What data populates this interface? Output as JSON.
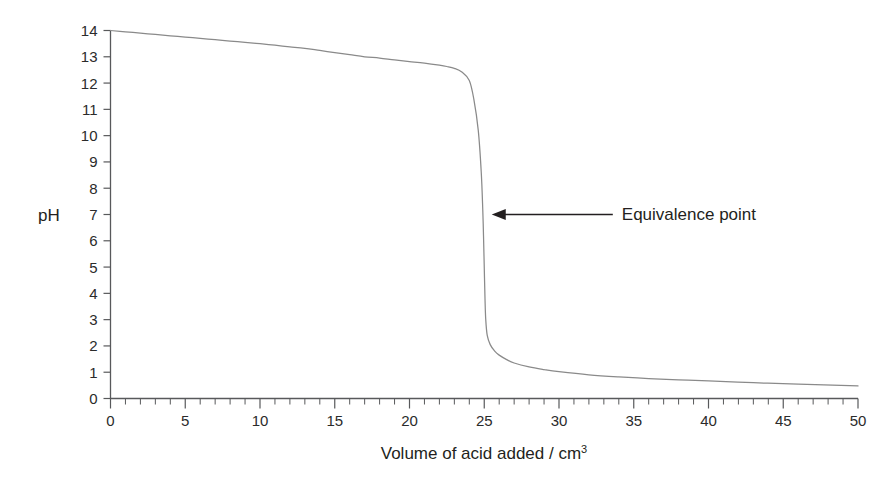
{
  "chart_data": {
    "type": "line",
    "title": "",
    "subtitle": "",
    "xlabel": "Volume of acid added / cm",
    "xlabel_superscript": "3",
    "ylabel": "pH",
    "xlim": [
      0,
      50
    ],
    "ylim": [
      0,
      14
    ],
    "grid": false,
    "legend_position": "none",
    "x_major_step": 5,
    "x_minor_step": 1,
    "y_major_step": 1,
    "x_tick_labels": [
      "0",
      "5",
      "10",
      "15",
      "20",
      "25",
      "30",
      "35",
      "40",
      "45",
      "50"
    ],
    "y_tick_labels": [
      "0",
      "1",
      "2",
      "3",
      "4",
      "5",
      "6",
      "7",
      "8",
      "9",
      "10",
      "11",
      "12",
      "13",
      "14"
    ],
    "line_color": "#8a8a8a",
    "axis_color": "#58595b",
    "annotations": [
      {
        "text": "Equivalence point",
        "arrow": "left-arrow",
        "point_x": 25,
        "point_y": 7,
        "text_x": 33.8,
        "text_y": 7
      }
    ],
    "series": [
      {
        "name": "Titration curve: strong base titrated with strong acid",
        "x": [
          0,
          1,
          2,
          3,
          4,
          5,
          6,
          7,
          8,
          9,
          10,
          11,
          12,
          13,
          14,
          15,
          16,
          17,
          18,
          19,
          20,
          21,
          22,
          22.5,
          23,
          23.5,
          24,
          24.3,
          24.6,
          24.8,
          24.9,
          24.95,
          25,
          25.05,
          25.1,
          25.2,
          25.4,
          25.7,
          26,
          26.5,
          27,
          28,
          29,
          30,
          32,
          34,
          36,
          38,
          40,
          43,
          46,
          50
        ],
        "y": [
          14,
          13.95,
          13.9,
          13.85,
          13.8,
          13.75,
          13.7,
          13.65,
          13.6,
          13.55,
          13.5,
          13.44,
          13.38,
          13.32,
          13.24,
          13.16,
          13.08,
          13.0,
          12.95,
          12.88,
          12.82,
          12.76,
          12.68,
          12.63,
          12.56,
          12.42,
          12.1,
          11.4,
          10.2,
          8.6,
          7.2,
          6.2,
          5.0,
          3.8,
          3.0,
          2.4,
          2.05,
          1.8,
          1.65,
          1.48,
          1.35,
          1.2,
          1.1,
          1.02,
          0.9,
          0.82,
          0.76,
          0.71,
          0.67,
          0.6,
          0.55,
          0.48
        ]
      }
    ]
  }
}
